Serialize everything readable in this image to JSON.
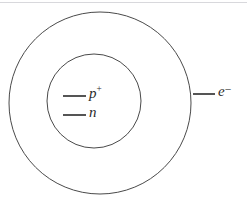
{
  "diagram": {
    "background_color": "#ffffff",
    "stroke_color": "#3a3a3a",
    "text_color": "#2b2b2b",
    "shells": [
      {
        "name": "electron-shell",
        "shape": "circle",
        "cx": 100,
        "cy": 103,
        "r": 91,
        "stroke_color": "#4a4a4a",
        "stroke_width": 1,
        "fill": "none"
      },
      {
        "name": "nucleus",
        "shape": "circle",
        "cx": 94,
        "cy": 101,
        "r": 47,
        "stroke_color": "#4a4a4a",
        "stroke_width": 1,
        "fill": "none"
      }
    ],
    "particles": [
      {
        "id": "proton",
        "symbol": "p",
        "charge": "+",
        "label_text": "p+",
        "tick": {
          "x1": 63,
          "y1": 96,
          "x2": 86,
          "y2": 96
        },
        "label_x": 89,
        "label_y": 86
      },
      {
        "id": "neutron",
        "symbol": "n",
        "charge": "",
        "label_text": "n",
        "tick": {
          "x1": 63,
          "y1": 115,
          "x2": 86,
          "y2": 115
        },
        "label_x": 89,
        "label_y": 105
      },
      {
        "id": "electron",
        "symbol": "e",
        "charge": "−",
        "label_text": "e−",
        "tick": {
          "x1": 193,
          "y1": 94,
          "x2": 215,
          "y2": 94
        },
        "label_x": 218,
        "label_y": 84
      }
    ]
  },
  "labels": {
    "proton_symbol": "p",
    "proton_charge": "+",
    "neutron_symbol": "n",
    "electron_symbol": "e",
    "electron_charge": "−"
  }
}
